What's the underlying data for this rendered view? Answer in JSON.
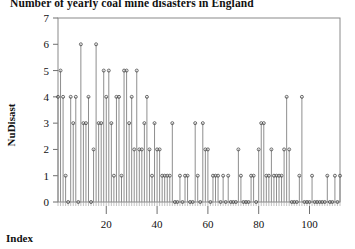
{
  "chart_data": {
    "type": "line",
    "title": "Number of yearly coal mine disasters in England",
    "xlabel": "Index",
    "ylabel": "NuDisast",
    "style": "stem-plot",
    "grid": false,
    "legend": "none",
    "xlim": [
      1,
      112
    ],
    "ylim": [
      0,
      7
    ],
    "ytick_labels": [
      "0",
      "1",
      "2",
      "3",
      "4",
      "5",
      "6",
      "7"
    ],
    "ytick_values": [
      0,
      1,
      2,
      3,
      4,
      5,
      6,
      7
    ],
    "xtick_labels": [
      "20",
      "40",
      "60",
      "80",
      "100"
    ],
    "xtick_values": [
      20,
      40,
      60,
      80,
      100
    ],
    "x": [
      1,
      2,
      3,
      4,
      5,
      6,
      7,
      8,
      9,
      10,
      11,
      12,
      13,
      14,
      15,
      16,
      17,
      18,
      19,
      20,
      21,
      22,
      23,
      24,
      25,
      26,
      27,
      28,
      29,
      30,
      31,
      32,
      33,
      34,
      35,
      36,
      37,
      38,
      39,
      40,
      41,
      42,
      43,
      44,
      45,
      46,
      47,
      48,
      49,
      50,
      51,
      52,
      53,
      54,
      55,
      56,
      57,
      58,
      59,
      60,
      61,
      62,
      63,
      64,
      65,
      66,
      67,
      68,
      69,
      70,
      71,
      72,
      73,
      74,
      75,
      76,
      77,
      78,
      79,
      80,
      81,
      82,
      83,
      84,
      85,
      86,
      87,
      88,
      89,
      90,
      91,
      92,
      93,
      94,
      95,
      96,
      97,
      98,
      99,
      100,
      101,
      102,
      103,
      104,
      105,
      106,
      107,
      108,
      109,
      110,
      111,
      112
    ],
    "values": [
      4,
      5,
      4,
      1,
      0,
      4,
      3,
      4,
      0,
      6,
      3,
      3,
      4,
      0,
      2,
      6,
      3,
      3,
      5,
      4,
      5,
      3,
      1,
      4,
      4,
      1,
      5,
      5,
      3,
      4,
      2,
      5,
      2,
      2,
      3,
      4,
      2,
      1,
      3,
      2,
      2,
      1,
      1,
      1,
      1,
      3,
      0,
      0,
      1,
      0,
      1,
      1,
      0,
      0,
      3,
      1,
      0,
      3,
      2,
      2,
      0,
      1,
      1,
      1,
      0,
      1,
      0,
      1,
      0,
      0,
      0,
      2,
      1,
      0,
      0,
      0,
      1,
      1,
      0,
      2,
      3,
      3,
      1,
      1,
      2,
      1,
      1,
      1,
      1,
      2,
      4,
      2,
      0,
      0,
      0,
      1,
      4,
      0,
      0,
      0,
      1,
      0,
      0,
      0,
      0,
      0,
      1,
      0,
      0,
      1,
      0,
      1
    ],
    "series": [
      {
        "name": "NuDisast",
        "values": [
          4,
          5,
          4,
          1,
          0,
          4,
          3,
          4,
          0,
          6,
          3,
          3,
          4,
          0,
          2,
          6,
          3,
          3,
          5,
          4,
          5,
          3,
          1,
          4,
          4,
          1,
          5,
          5,
          3,
          4,
          2,
          5,
          2,
          2,
          3,
          4,
          2,
          1,
          3,
          2,
          2,
          1,
          1,
          1,
          1,
          3,
          0,
          0,
          1,
          0,
          1,
          1,
          0,
          0,
          3,
          1,
          0,
          3,
          2,
          2,
          0,
          1,
          1,
          1,
          0,
          1,
          0,
          1,
          0,
          0,
          0,
          2,
          1,
          0,
          0,
          0,
          1,
          1,
          0,
          2,
          3,
          3,
          1,
          1,
          2,
          1,
          1,
          1,
          1,
          2,
          4,
          2,
          0,
          0,
          0,
          1,
          4,
          0,
          0,
          0,
          1,
          0,
          0,
          0,
          0,
          0,
          1,
          0,
          0,
          1,
          0,
          1
        ]
      }
    ],
    "colors": {
      "stem": "#8e8e8e",
      "point": "#4a4a4a",
      "frame": "#8a8a8a",
      "text": "#111111",
      "background": "#ffffff"
    }
  }
}
